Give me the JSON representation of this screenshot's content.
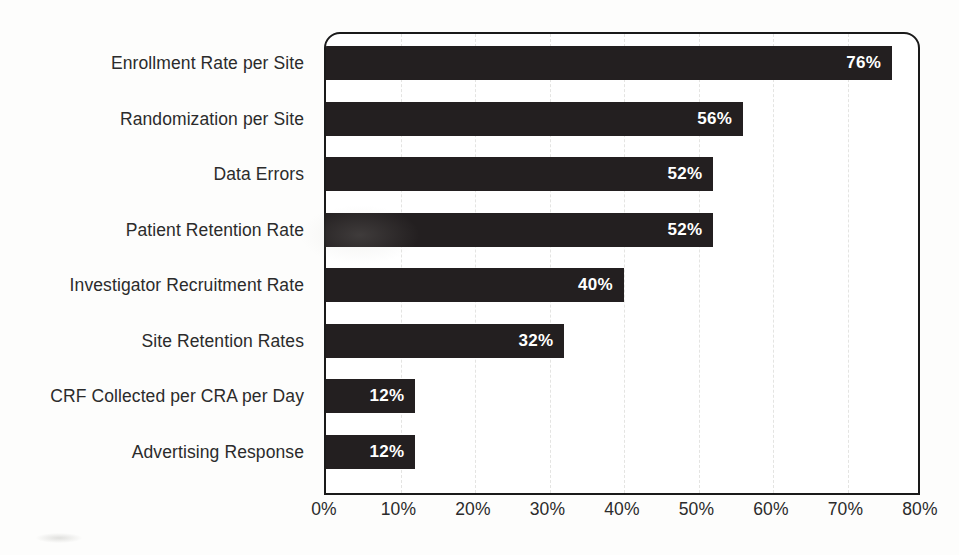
{
  "chart_data": {
    "type": "bar",
    "orientation": "horizontal",
    "title": "",
    "subtitle": "",
    "xlabel": "",
    "ylabel": "",
    "categories": [
      "Enrollment Rate per Site",
      "Randomization per Site",
      "Data Errors",
      "Patient Retention Rate",
      "Investigator Recruitment Rate",
      "Site Retention Rates",
      "CRF Collected per CRA per Day",
      "Advertising Response"
    ],
    "values": [
      76,
      56,
      52,
      52,
      40,
      32,
      12,
      12
    ],
    "value_labels": [
      "76%",
      "56%",
      "52%",
      "52%",
      "40%",
      "32%",
      "12%",
      "12%"
    ],
    "xlim": [
      0,
      80
    ],
    "x_tick_values": [
      0,
      10,
      20,
      30,
      40,
      50,
      60,
      70,
      80
    ],
    "x_tick_labels": [
      "0%",
      "10%",
      "20%",
      "30%",
      "40%",
      "50%",
      "60%",
      "70%",
      "80%"
    ],
    "grid": "vertical-dashed",
    "legend": "none",
    "bar_color": "#231f20",
    "value_label_color": "#ffffff",
    "axis_text_color": "#2b2b2b",
    "gridline_color": "#e4e4e2",
    "plot_border_color": "#1a1a1a",
    "background_color": "#ffffff"
  }
}
